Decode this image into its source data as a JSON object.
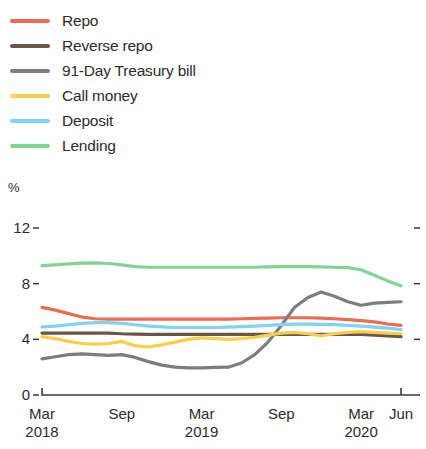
{
  "figure": {
    "unit_label": "%"
  },
  "legend": {
    "position": "top-left",
    "items": [
      {
        "label": "Repo",
        "color": "#ef6a52",
        "swatch_name": "legend-swatch-repo"
      },
      {
        "label": "Reverse repo",
        "color": "#6b5547",
        "swatch_name": "legend-swatch-reverse-repo"
      },
      {
        "label": "91-Day Treasury bill",
        "color": "#7d7d7d",
        "swatch_name": "legend-swatch-treasury-bill"
      },
      {
        "label": "Call money",
        "color": "#f7cf4a",
        "swatch_name": "legend-swatch-call-money"
      },
      {
        "label": "Deposit",
        "color": "#7fd4ef",
        "swatch_name": "legend-swatch-deposit"
      },
      {
        "label": "Lending",
        "color": "#7fd694",
        "swatch_name": "legend-swatch-lending"
      }
    ]
  },
  "axes": {
    "y_ticks": [
      "12",
      "8",
      "4",
      "0"
    ],
    "x_ticks": [
      {
        "label": "Mar",
        "sublabel": "2018"
      },
      {
        "label": "Sep",
        "sublabel": ""
      },
      {
        "label": "Mar",
        "sublabel": "2019"
      },
      {
        "label": "Sep",
        "sublabel": ""
      },
      {
        "label": "Mar",
        "sublabel": "2020"
      },
      {
        "label": "Jun",
        "sublabel": ""
      }
    ]
  },
  "chart_data": {
    "type": "line",
    "title": "",
    "subtitle": "",
    "xlabel": "",
    "ylabel": "%",
    "ylim": [
      0,
      13
    ],
    "xlim": [
      0,
      27
    ],
    "grid": false,
    "legend_position": "top-left",
    "x": [
      0,
      1,
      2,
      3,
      4,
      5,
      6,
      7,
      8,
      9,
      10,
      11,
      12,
      13,
      14,
      15,
      16,
      17,
      18,
      19,
      20,
      21,
      22,
      23,
      24,
      25,
      26,
      27
    ],
    "x_tick_positions": [
      0,
      6,
      12,
      18,
      24,
      27
    ],
    "x_tick_labels": [
      "Mar 2018",
      "Sep",
      "Mar 2019",
      "Sep",
      "Mar 2020",
      "Jun"
    ],
    "series": [
      {
        "name": "Repo",
        "color": "#ef6a52",
        "values": [
          6.3,
          6.1,
          5.85,
          5.6,
          5.48,
          5.45,
          5.45,
          5.45,
          5.45,
          5.45,
          5.45,
          5.45,
          5.45,
          5.45,
          5.45,
          5.48,
          5.5,
          5.52,
          5.55,
          5.55,
          5.55,
          5.52,
          5.48,
          5.42,
          5.35,
          5.25,
          5.1,
          5.0
        ]
      },
      {
        "name": "Reverse repo",
        "color": "#6b5547",
        "values": [
          4.45,
          4.45,
          4.45,
          4.45,
          4.45,
          4.45,
          4.4,
          4.38,
          4.35,
          4.35,
          4.35,
          4.35,
          4.35,
          4.35,
          4.35,
          4.35,
          4.35,
          4.35,
          4.35,
          4.35,
          4.35,
          4.35,
          4.35,
          4.35,
          4.35,
          4.3,
          4.25,
          4.2
        ]
      },
      {
        "name": "91-Day Treasury bill",
        "color": "#7d7d7d",
        "values": [
          2.6,
          2.75,
          2.9,
          2.95,
          2.9,
          2.85,
          2.9,
          2.7,
          2.4,
          2.15,
          2.0,
          1.95,
          1.95,
          1.98,
          2.0,
          2.3,
          2.9,
          3.8,
          5.0,
          6.3,
          7.0,
          7.4,
          7.1,
          6.7,
          6.45,
          6.6,
          6.65,
          6.7
        ]
      },
      {
        "name": "Call money",
        "color": "#f7cf4a",
        "values": [
          4.2,
          4.05,
          3.85,
          3.7,
          3.65,
          3.7,
          3.85,
          3.55,
          3.45,
          3.6,
          3.8,
          4.0,
          4.1,
          4.05,
          4.0,
          4.05,
          4.15,
          4.3,
          4.45,
          4.5,
          4.4,
          4.25,
          4.4,
          4.5,
          4.55,
          4.5,
          4.45,
          4.4
        ]
      },
      {
        "name": "Deposit",
        "color": "#7fd4ef",
        "values": [
          4.9,
          4.95,
          5.05,
          5.15,
          5.2,
          5.2,
          5.15,
          5.05,
          4.95,
          4.9,
          4.85,
          4.85,
          4.85,
          4.85,
          4.88,
          4.92,
          4.95,
          5.0,
          5.05,
          5.1,
          5.1,
          5.08,
          5.05,
          5.0,
          4.95,
          4.88,
          4.8,
          4.7
        ]
      },
      {
        "name": "Lending",
        "color": "#7fd694",
        "values": [
          9.3,
          9.35,
          9.42,
          9.48,
          9.5,
          9.45,
          9.35,
          9.22,
          9.18,
          9.18,
          9.18,
          9.18,
          9.18,
          9.18,
          9.18,
          9.18,
          9.18,
          9.2,
          9.22,
          9.22,
          9.22,
          9.2,
          9.18,
          9.15,
          9.0,
          8.6,
          8.2,
          7.85
        ]
      }
    ]
  }
}
